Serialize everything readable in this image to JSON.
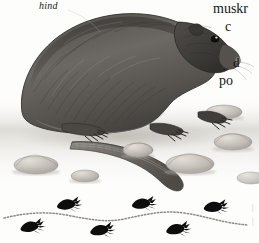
{
  "page": {
    "background_color": "#fdfdfc",
    "width": 259,
    "height": 243
  },
  "illustration": {
    "name": "muskrat-illustration",
    "subject": "muskrat",
    "style": "grayscale pencil field-guide drawing",
    "description": "A muskrat standing in left profile on a pebbled ground, with a long scaly tail trailing down and to the right, clawed front and hind feet visible, and scattered rocks around it.",
    "ink_color": "#3b3936",
    "fur_dark": "#4a4744",
    "fur_mid": "#6e6b66",
    "fur_light": "#a9a49d",
    "ground_color": "#cfcbc4",
    "rock_color": "#bdb9b2",
    "rock_shadow": "#a29d96",
    "eye_color": "#141312"
  },
  "labels": {
    "hind": {
      "text": "hind",
      "style": "italic"
    }
  },
  "body_text": {
    "note": "right-hand column text cropped by the page edge",
    "lines": [
      "muskr",
      "c",
      "d",
      "po"
    ]
  },
  "tracks": {
    "name": "track-diagram",
    "description": "Wavy dotted tail-drag line with paw prints alternating above and below",
    "print_color": "#0d0d0d",
    "trail_color": "#8d8a85",
    "trail_label": "tail-drag-line",
    "print_count": 6,
    "prints": [
      {
        "id": "print-1",
        "x": 31,
        "y": 229,
        "row": "lower",
        "rotation": -14
      },
      {
        "id": "print-2",
        "x": 68,
        "y": 206,
        "row": "upper",
        "rotation": -10
      },
      {
        "id": "print-3",
        "x": 101,
        "y": 232,
        "row": "lower",
        "rotation": -12
      },
      {
        "id": "print-4",
        "x": 143,
        "y": 205,
        "row": "upper",
        "rotation": -9
      },
      {
        "id": "print-5",
        "x": 177,
        "y": 231,
        "row": "lower",
        "rotation": -12
      },
      {
        "id": "print-6",
        "x": 215,
        "y": 208,
        "row": "upper",
        "rotation": -8
      }
    ]
  },
  "edge_marks": {
    "text": "|\n|",
    "description": "faint cropped rules at the right page edge"
  }
}
